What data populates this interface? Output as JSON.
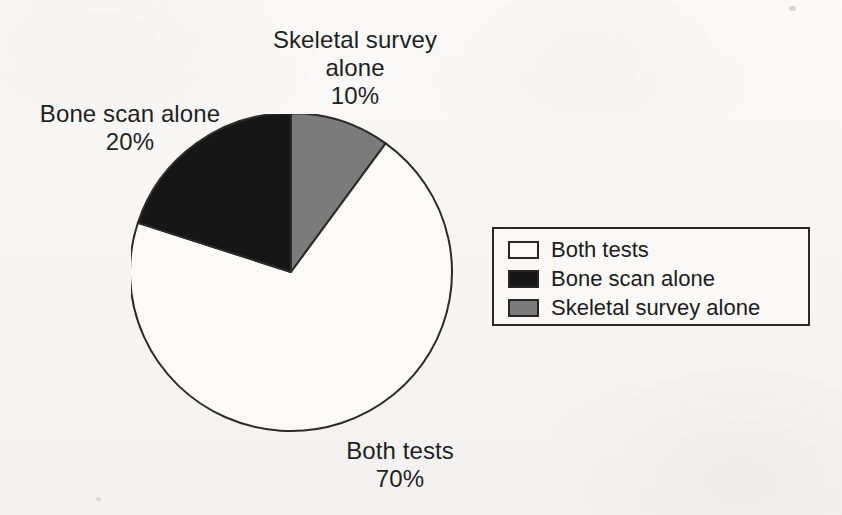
{
  "background_color": "#f6f5f3",
  "callouts": {
    "skeletal": {
      "line1": "Skeletal survey",
      "line2": "alone",
      "line3": "10%"
    },
    "bone_scan": {
      "line1": "Bone scan alone",
      "line2": "20%"
    },
    "both_tests": {
      "line1": "Both tests",
      "line2": "70%"
    }
  },
  "legend": {
    "items": [
      {
        "label": "Both tests",
        "color": "#fbfaf8"
      },
      {
        "label": "Bone scan alone",
        "color": "#161616"
      },
      {
        "label": "Skeletal survey alone",
        "color": "#7b7b7b"
      }
    ]
  },
  "chart_data": {
    "type": "pie",
    "title": "",
    "categories": [
      "Both tests",
      "Bone scan alone",
      "Skeletal survey alone"
    ],
    "values": [
      70,
      20,
      10
    ],
    "value_unit": "%",
    "labels": [
      "Both tests 70%",
      "Bone scan alone 20%",
      "Skeletal survey alone 10%"
    ],
    "colors": [
      "#fbfaf8",
      "#161616",
      "#7b7b7b"
    ],
    "slice_outline_color": "#2b2b2b",
    "start_angle_deg": 0,
    "direction": "clockwise",
    "legend_position": "right",
    "grid": false,
    "slices": [
      {
        "name": "Skeletal survey alone",
        "value": 10,
        "start_deg": 0,
        "end_deg": 36,
        "color": "#7b7b7b"
      },
      {
        "name": "Both tests",
        "value": 70,
        "start_deg": 36,
        "end_deg": 288,
        "color": "#fbfaf8"
      },
      {
        "name": "Bone scan alone",
        "value": 20,
        "start_deg": 288,
        "end_deg": 360,
        "color": "#161616"
      }
    ]
  }
}
